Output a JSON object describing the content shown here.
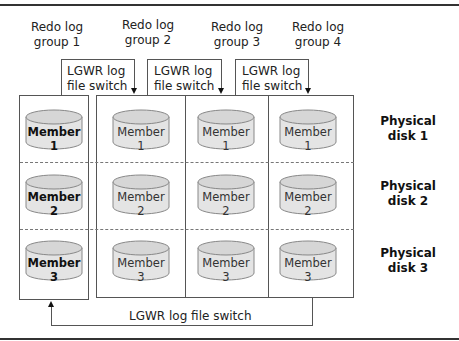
{
  "diagram": {
    "groups": [
      {
        "label_line1": "Redo log",
        "label_line2": "group 1"
      },
      {
        "label_line1": "Redo log",
        "label_line2": "group 2"
      },
      {
        "label_line1": "Redo log",
        "label_line2": "group 3"
      },
      {
        "label_line1": "Redo log",
        "label_line2": "group 4"
      }
    ],
    "switch_labels": [
      {
        "line1": "LGWR log",
        "line2": "file switch"
      },
      {
        "line1": "LGWR log",
        "line2": "file switch"
      },
      {
        "line1": "LGWR log",
        "line2": "file switch"
      }
    ],
    "bottom_switch_label": "LGWR log file switch",
    "members": [
      "Member 1",
      "Member 2",
      "Member 3"
    ],
    "disks": [
      {
        "line1": "Physical",
        "line2": "disk 1"
      },
      {
        "line1": "Physical",
        "line2": "disk 2"
      },
      {
        "line1": "Physical",
        "line2": "disk 3"
      }
    ],
    "colors": {
      "line": "#555555",
      "cylinder_fill": "#e2e2e2",
      "cylinder_top": "#d4d4d4",
      "text": "#222222"
    }
  }
}
